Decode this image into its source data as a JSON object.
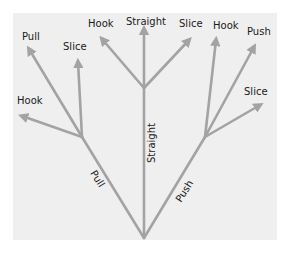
{
  "diagram": {
    "type": "tree",
    "colors": {
      "background": "#ffffff",
      "panel": "#efefef",
      "line": "#a3a3a3",
      "text": "#1a1a1a"
    },
    "trunks": [
      {
        "label": "Pull"
      },
      {
        "label": "Straight"
      },
      {
        "label": "Push"
      }
    ],
    "branches": {
      "pull": [
        "Pull",
        "Slice",
        "Hook"
      ],
      "straight": [
        "Hook",
        "Straight",
        "Slice"
      ],
      "push": [
        "Hook",
        "Push",
        "Slice"
      ]
    }
  }
}
